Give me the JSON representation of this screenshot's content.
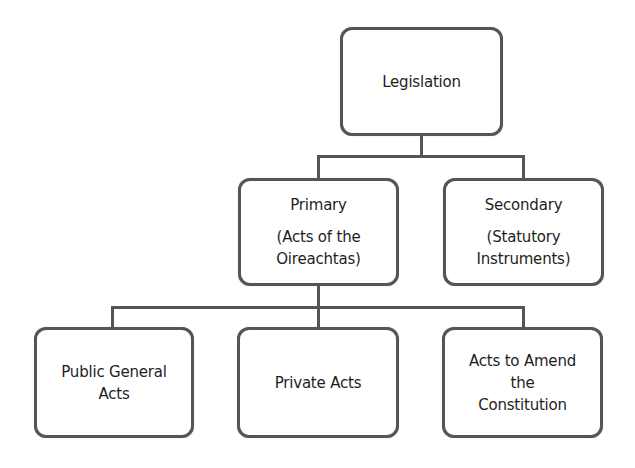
{
  "diagram": {
    "type": "hierarchy",
    "root": {
      "label": "Legislation",
      "lines": [
        "Legislation"
      ]
    },
    "level2": [
      {
        "label": "Primary (Acts of the Oireachtas)",
        "title": "Primary",
        "lines": [
          "(Acts of the",
          "Oireachtas)"
        ]
      },
      {
        "label": "Secondary (Statutory Instruments)",
        "title": "Secondary",
        "lines": [
          "(Statutory",
          "Instruments)"
        ]
      }
    ],
    "level3": [
      {
        "label": "Public General Acts",
        "lines": [
          "Public General",
          "Acts"
        ]
      },
      {
        "label": "Private Acts",
        "lines": [
          "Private Acts"
        ]
      },
      {
        "label": "Acts to Amend the Constitution",
        "lines": [
          "Acts to Amend",
          "the",
          "Constitution"
        ]
      }
    ],
    "edges": [
      [
        "Legislation",
        "Primary"
      ],
      [
        "Legislation",
        "Secondary"
      ],
      [
        "Primary",
        "Public General Acts"
      ],
      [
        "Primary",
        "Private Acts"
      ],
      [
        "Primary",
        "Acts to Amend the Constitution"
      ]
    ],
    "colors": {
      "border": "#555555",
      "text": "#1e1e1e",
      "background": "#ffffff"
    }
  }
}
